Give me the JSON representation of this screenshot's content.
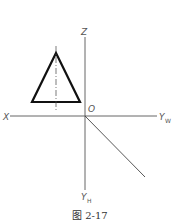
{
  "figure": {
    "caption": "图 2-17",
    "axes": {
      "z_label": "Z",
      "x_label": "X",
      "origin_label": "O",
      "yw_label": "Y",
      "yw_subscript": "W",
      "yh_label": "Y",
      "yh_subscript": "H"
    },
    "shapes": [
      {
        "type": "triangle",
        "description": "isosceles triangle (front view) with vertical center line"
      },
      {
        "type": "line",
        "description": "45-degree projection line from origin toward lower right"
      }
    ],
    "colors": {
      "shape_stroke": "#111111",
      "axis_stroke": "#555555",
      "background": "#ffffff"
    }
  }
}
